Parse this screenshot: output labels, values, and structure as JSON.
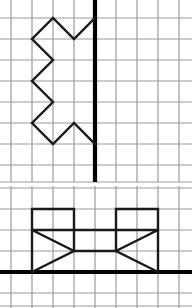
{
  "figure": {
    "type": "grid-diagram",
    "canvas": {
      "width": 192,
      "height": 308
    },
    "colors": {
      "background": "#ffffff",
      "grid_line": "#9a9a9a",
      "figure_stroke": "#1a1a1a",
      "heavy_line": "#000000"
    },
    "grid": {
      "cell_size": 21,
      "line_width": 1.2,
      "figure_line_width": 2.4,
      "heavy_line_width": 4.2
    }
  },
  "panels": [
    {
      "id": "top-panel",
      "name": "top-grid-panel",
      "origin": {
        "x": 0,
        "y": 0
      },
      "size": {
        "width": 192,
        "height": 182
      },
      "grid": {
        "x_lines": [
          11,
          32,
          53,
          74,
          95,
          116,
          137,
          158,
          179
        ],
        "y_lines": [
          -3,
          18,
          39,
          60,
          81,
          102,
          123,
          144,
          165,
          182
        ]
      },
      "heavy_lines": [
        {
          "name": "vertical-axis-line",
          "x1": 95,
          "y1": 0,
          "x2": 95,
          "y2": 182
        }
      ],
      "figure": {
        "name": "zigzag-arrow-figure",
        "closed": false,
        "points": [
          [
            95,
            18
          ],
          [
            74,
            39
          ],
          [
            53,
            18
          ],
          [
            32,
            39
          ],
          [
            53,
            60
          ],
          [
            32,
            81
          ],
          [
            53,
            102
          ],
          [
            32,
            123
          ],
          [
            53,
            144
          ],
          [
            74,
            123
          ],
          [
            95,
            144
          ]
        ]
      }
    },
    {
      "id": "bottom-panel",
      "name": "bottom-grid-panel",
      "origin": {
        "x": 0,
        "y": 186
      },
      "size": {
        "width": 192,
        "height": 122
      },
      "grid": {
        "x_lines": [
          11,
          32,
          53,
          74,
          95,
          116,
          137,
          158,
          179
        ],
        "y_lines": [
          2,
          23,
          44,
          65,
          86,
          107,
          120
        ]
      },
      "heavy_lines": [
        {
          "name": "horizontal-base-line",
          "x1": 0,
          "y1": 86,
          "x2": 192,
          "y2": 86
        }
      ],
      "figure": {
        "name": "bracket-chain-figure",
        "closed": false,
        "segments": [
          {
            "name": "left-bracket-segment",
            "points": [
              [
                32,
                86
              ],
              [
                32,
                23
              ],
              [
                74,
                23
              ],
              [
                74,
                44
              ],
              [
                32,
                44
              ],
              [
                74,
                65
              ],
              [
                32,
                86
              ]
            ]
          },
          {
            "name": "right-bracket-segment",
            "points": [
              [
                158,
                86
              ],
              [
                158,
                23
              ],
              [
                116,
                23
              ],
              [
                116,
                44
              ],
              [
                158,
                44
              ],
              [
                116,
                65
              ],
              [
                158,
                86
              ]
            ]
          },
          {
            "name": "center-box-segment",
            "points": [
              [
                74,
                44
              ],
              [
                116,
                44
              ],
              [
                116,
                65
              ],
              [
                74,
                65
              ],
              [
                74,
                44
              ]
            ]
          }
        ]
      }
    }
  ],
  "labels": {
    "panel_top_caption": "",
    "panel_bottom_caption": ""
  }
}
